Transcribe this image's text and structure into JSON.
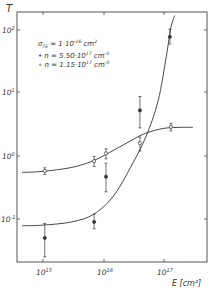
{
  "chart_data": {
    "type": "scatter",
    "title": "",
    "xlabel": "E [cm⁻²]",
    "ylabel": "T",
    "xscale": "log",
    "yscale": "log",
    "xlim": [
      300000000000000.0,
      4e+17
    ],
    "ylim": [
      0.02,
      200
    ],
    "x_ticks": [
      1000000000000000.0,
      1e+16,
      1e+17
    ],
    "x_tick_labels": [
      "10^15",
      "10^16",
      "10^17"
    ],
    "y_ticks": [
      0.1,
      1,
      10,
      100
    ],
    "y_tick_labels": [
      "10^-1",
      "10^0",
      "10^1",
      "10^2"
    ],
    "grid": false,
    "annotations": [
      "σTE = 1·10^-16 cm^2"
    ],
    "legend_position": "upper-left",
    "series": [
      {
        "name": "n = 5.50·10^17 cm^-3",
        "marker": "filled-circle",
        "x": [
          1070000000000000.0,
          7000000000000000.0,
          1.1e+16,
          4e+16,
          1.25e+17
        ],
        "y": [
          0.05,
          0.09,
          0.47,
          5.3,
          78
        ],
        "y_err_low": [
          0.025,
          0.02,
          0.2,
          2.5,
          18
        ],
        "y_err_high": [
          0.035,
          0.03,
          0.3,
          3.5,
          25
        ],
        "fit_curve": {
          "x": [
            450000000000000.0,
            1000000000000000.0,
            3000000000000000.0,
            7000000000000000.0,
            1.5e+16,
            3e+16,
            5e+16,
            8e+16,
            1.1e+17,
            1.3e+17,
            1.5e+17
          ],
          "y": [
            0.078,
            0.08,
            0.09,
            0.12,
            0.24,
            0.75,
            2.0,
            7.5,
            40,
            110,
            170
          ]
        }
      },
      {
        "name": "n = 1.15·10^17 cm^-3",
        "marker": "open-circle",
        "x": [
          1070000000000000.0,
          7000000000000000.0,
          1.1e+16,
          4e+16,
          1.3e+17
        ],
        "y": [
          0.58,
          0.83,
          1.1,
          1.6,
          2.9
        ],
        "y_err_low": [
          0.07,
          0.15,
          0.2,
          0.4,
          0.4
        ],
        "y_err_high": [
          0.07,
          0.15,
          0.2,
          0.4,
          0.4
        ],
        "fit_curve": {
          "x": [
            450000000000000.0,
            1000000000000000.0,
            3000000000000000.0,
            7000000000000000.0,
            1.5e+16,
            3e+16,
            5e+16,
            1e+17,
            2e+17,
            3e+17
          ],
          "y": [
            0.55,
            0.57,
            0.66,
            0.85,
            1.25,
            1.8,
            2.3,
            2.75,
            2.85,
            2.85
          ]
        }
      }
    ]
  },
  "labels": {
    "y_axis": "T",
    "x_axis": "E [cm²]",
    "sigma_line": "σ",
    "sigma_sub": "TE",
    "sigma_value": " = 1·10",
    "sigma_exp": "-16",
    "sigma_unit": " cm",
    "sigma_unit_exp": "2",
    "legend_filled": "• n = 5.50·10",
    "legend_filled_exp": "17",
    "legend_filled_unit": " cm",
    "legend_filled_unit_exp": "-3",
    "legend_open": "∘ n = 1.15·10",
    "legend_open_exp": "17",
    "legend_open_unit": " cm",
    "legend_open_unit_exp": "-3",
    "ytick_2": "10",
    "ytick_2_exp": "2",
    "ytick_1": "10",
    "ytick_1_exp": "1",
    "ytick_0": "10",
    "ytick_0_exp": "0",
    "ytick_m1": "10",
    "ytick_m1_exp": "-1",
    "xtick_15": "10",
    "xtick_15_exp": "15",
    "xtick_16": "10",
    "xtick_16_exp": "16",
    "xtick_17": "10",
    "xtick_17_exp": "17"
  },
  "colors": {
    "ink": "#333333",
    "background": "#ffffff"
  }
}
